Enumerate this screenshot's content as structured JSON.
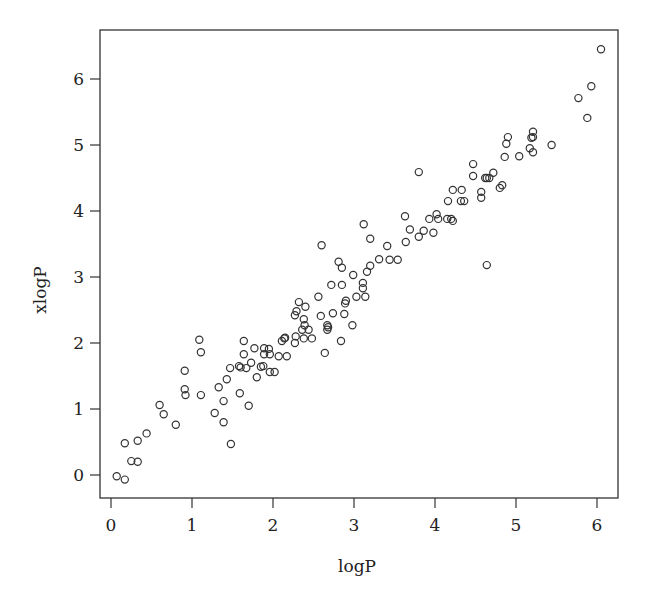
{
  "chart_data": {
    "type": "scatter",
    "title": "",
    "xlabel": "logP",
    "ylabel": "xlogP",
    "xlim": [
      -0.15,
      6.25
    ],
    "ylim": [
      -0.35,
      6.7
    ],
    "xticks": [
      0,
      1,
      2,
      3,
      4,
      5,
      6
    ],
    "yticks": [
      0,
      1,
      2,
      3,
      4,
      5,
      6
    ],
    "grid": false,
    "legend": null,
    "marker": "open-circle",
    "color": "#333333",
    "points": [
      [
        0.07,
        -0.02
      ],
      [
        0.17,
        -0.07
      ],
      [
        0.17,
        0.48
      ],
      [
        0.25,
        0.21
      ],
      [
        0.33,
        0.2
      ],
      [
        0.33,
        0.52
      ],
      [
        0.44,
        0.63
      ],
      [
        0.6,
        1.06
      ],
      [
        0.65,
        0.92
      ],
      [
        0.8,
        0.76
      ],
      [
        0.91,
        1.3
      ],
      [
        0.92,
        1.21
      ],
      [
        0.91,
        1.58
      ],
      [
        1.11,
        1.21
      ],
      [
        1.09,
        2.05
      ],
      [
        1.11,
        1.86
      ],
      [
        1.28,
        0.94
      ],
      [
        1.39,
        0.8
      ],
      [
        1.39,
        1.12
      ],
      [
        1.33,
        1.33
      ],
      [
        1.43,
        1.45
      ],
      [
        1.48,
        0.47
      ],
      [
        1.59,
        1.24
      ],
      [
        1.7,
        1.05
      ],
      [
        1.47,
        1.62
      ],
      [
        1.58,
        1.65
      ],
      [
        1.6,
        1.63
      ],
      [
        1.67,
        1.62
      ],
      [
        1.73,
        1.7
      ],
      [
        1.64,
        2.03
      ],
      [
        1.64,
        1.83
      ],
      [
        1.77,
        1.92
      ],
      [
        1.8,
        1.48
      ],
      [
        1.85,
        1.64
      ],
      [
        1.88,
        1.65
      ],
      [
        1.89,
        1.92
      ],
      [
        1.95,
        1.91
      ],
      [
        1.89,
        1.83
      ],
      [
        1.96,
        1.83
      ],
      [
        1.96,
        1.56
      ],
      [
        2.02,
        1.56
      ],
      [
        2.07,
        1.8
      ],
      [
        2.17,
        1.8
      ],
      [
        2.11,
        2.03
      ],
      [
        2.15,
        2.08
      ],
      [
        2.14,
        2.07
      ],
      [
        2.27,
        2.0
      ],
      [
        2.28,
        2.1
      ],
      [
        2.38,
        2.07
      ],
      [
        2.48,
        2.07
      ],
      [
        2.36,
        2.2
      ],
      [
        2.44,
        2.2
      ],
      [
        2.39,
        2.27
      ],
      [
        2.38,
        2.36
      ],
      [
        2.27,
        2.42
      ],
      [
        2.29,
        2.48
      ],
      [
        2.4,
        2.55
      ],
      [
        2.32,
        2.62
      ],
      [
        2.56,
        2.7
      ],
      [
        2.59,
        2.41
      ],
      [
        2.64,
        1.85
      ],
      [
        2.67,
        2.2
      ],
      [
        2.67,
        2.27
      ],
      [
        2.68,
        2.24
      ],
      [
        2.74,
        2.45
      ],
      [
        2.72,
        2.88
      ],
      [
        2.6,
        3.48
      ],
      [
        2.81,
        3.23
      ],
      [
        2.85,
        3.14
      ],
      [
        2.85,
        2.88
      ],
      [
        2.84,
        2.03
      ],
      [
        2.88,
        2.44
      ],
      [
        2.89,
        2.6
      ],
      [
        2.9,
        2.64
      ],
      [
        2.98,
        2.27
      ],
      [
        2.99,
        3.03
      ],
      [
        3.03,
        2.7
      ],
      [
        3.11,
        2.91
      ],
      [
        3.11,
        2.83
      ],
      [
        3.14,
        2.7
      ],
      [
        3.16,
        3.08
      ],
      [
        3.2,
        3.17
      ],
      [
        3.12,
        3.8
      ],
      [
        3.2,
        3.58
      ],
      [
        3.31,
        3.27
      ],
      [
        3.41,
        3.47
      ],
      [
        3.44,
        3.26
      ],
      [
        3.54,
        3.26
      ],
      [
        3.63,
        3.92
      ],
      [
        3.64,
        3.53
      ],
      [
        3.69,
        3.72
      ],
      [
        3.8,
        3.61
      ],
      [
        3.86,
        3.7
      ],
      [
        3.8,
        4.59
      ],
      [
        3.93,
        3.88
      ],
      [
        3.98,
        3.67
      ],
      [
        4.02,
        3.95
      ],
      [
        4.04,
        3.88
      ],
      [
        4.15,
        3.88
      ],
      [
        4.2,
        3.88
      ],
      [
        4.22,
        3.85
      ],
      [
        4.16,
        4.15
      ],
      [
        4.22,
        4.32
      ],
      [
        4.33,
        4.32
      ],
      [
        4.32,
        4.15
      ],
      [
        4.36,
        4.15
      ],
      [
        4.47,
        4.71
      ],
      [
        4.47,
        4.53
      ],
      [
        4.57,
        4.29
      ],
      [
        4.57,
        4.2
      ],
      [
        4.62,
        4.5
      ],
      [
        4.64,
        4.5
      ],
      [
        4.67,
        4.5
      ],
      [
        4.72,
        4.58
      ],
      [
        4.64,
        3.18
      ],
      [
        4.8,
        4.35
      ],
      [
        4.83,
        4.39
      ],
      [
        4.86,
        4.82
      ],
      [
        4.88,
        5.02
      ],
      [
        4.9,
        5.12
      ],
      [
        5.04,
        4.83
      ],
      [
        5.17,
        4.95
      ],
      [
        5.21,
        4.89
      ],
      [
        5.19,
        5.11
      ],
      [
        5.21,
        5.12
      ],
      [
        5.21,
        5.2
      ],
      [
        5.44,
        5.0
      ],
      [
        5.77,
        5.71
      ],
      [
        5.88,
        5.41
      ],
      [
        5.93,
        5.89
      ],
      [
        6.05,
        6.45
      ]
    ]
  }
}
